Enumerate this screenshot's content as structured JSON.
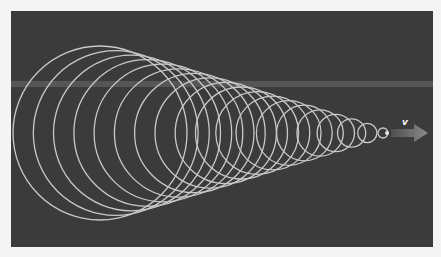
{
  "diagram": {
    "velocity_label": "v",
    "colors": {
      "background": "#3b3b3b",
      "page": "#f4f4f4",
      "band": "#565656",
      "wavefront": "#c9c9c9",
      "arrow_start": "#4f4f4f",
      "arrow_end": "#8a8a8a",
      "source": "#e6e6e6",
      "label": "#ffffff"
    },
    "wavefronts": {
      "count": 19,
      "center_y": 133,
      "largest": {
        "cx": 100,
        "r": 87
      },
      "smallest": {
        "cx": 383,
        "r": 5
      }
    },
    "source": {
      "x": 387,
      "y": 133
    },
    "arrow": {
      "x_start": 391,
      "x_body_end": 414,
      "x_tip": 428,
      "y": 133
    },
    "label_pos": {
      "x": 402,
      "y": 117
    }
  }
}
